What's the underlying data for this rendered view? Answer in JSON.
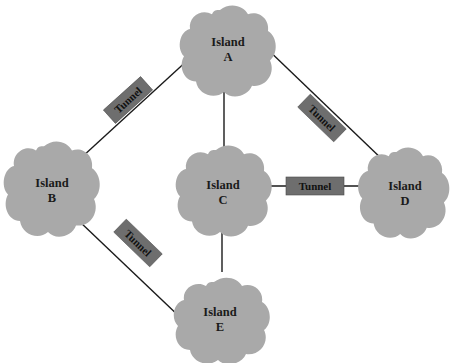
{
  "diagram": {
    "type": "network-topology",
    "nodes": [
      {
        "id": "A",
        "line1": "Island",
        "line2": "A",
        "x": 228,
        "y": 50
      },
      {
        "id": "B",
        "line1": "Island",
        "line2": "B",
        "x": 51,
        "y": 187
      },
      {
        "id": "C",
        "line1": "Island",
        "line2": "C",
        "x": 222,
        "y": 190
      },
      {
        "id": "D",
        "line1": "Island",
        "line2": "D",
        "x": 405,
        "y": 190
      },
      {
        "id": "E",
        "line1": "Island",
        "line2": "E",
        "x": 220,
        "y": 321
      }
    ],
    "edges": [
      {
        "from": "A",
        "to": "B",
        "tunnel": true
      },
      {
        "from": "A",
        "to": "D",
        "tunnel": true
      },
      {
        "from": "A",
        "to": "C",
        "tunnel": false
      },
      {
        "from": "C",
        "to": "D",
        "tunnel": true
      },
      {
        "from": "C",
        "to": "E",
        "tunnel": false
      },
      {
        "from": "B",
        "to": "E",
        "tunnel": false
      }
    ],
    "tunnels": [
      {
        "label": "Tunnel",
        "between": "A-B"
      },
      {
        "label": "Tunnel",
        "between": "A-D"
      },
      {
        "label": "Tunnel",
        "between": "C-D"
      },
      {
        "label": "Tunnel",
        "near": "B-E"
      }
    ],
    "colors": {
      "cloud": "#a9a9a9",
      "tunnel": "#6e6e6e",
      "line": "#1a1a1a"
    }
  }
}
